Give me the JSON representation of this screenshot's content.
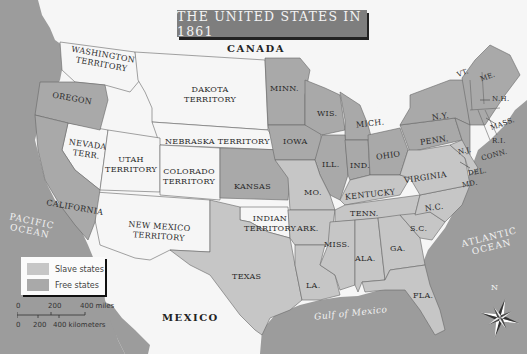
{
  "title": "THE UNITED STATES IN 1861",
  "colors": {
    "water": "#9c9c9c",
    "free_states": "#a9a9a9",
    "slave_states": "#c6c6c6",
    "territories": "#f6f6f6",
    "foreign": "#ffffff",
    "title_bg": "#7e7e7e",
    "border": "#5a5a5a"
  },
  "legend": {
    "items": [
      {
        "label": "Slave states",
        "color": "#c6c6c6"
      },
      {
        "label": "Free states",
        "color": "#a9a9a9"
      }
    ]
  },
  "scale": {
    "miles_ticks": [
      "0",
      "200",
      "400 miles"
    ],
    "km_ticks": [
      "0",
      "200",
      "400 kilometers"
    ]
  },
  "compass": {
    "north_label": "N"
  },
  "water_labels": {
    "pacific": [
      "PACIFIC",
      "OCEAN"
    ],
    "atlantic": [
      "ATLANTIC",
      "OCEAN"
    ],
    "gulf": "Gulf of Mexico"
  },
  "country_labels": {
    "canada": "CANADA",
    "mexico": "MEXICO"
  },
  "regions": {
    "washington": [
      "WASHINGTON",
      "TERRITORY"
    ],
    "oregon": "OREGON",
    "california": "CALIFORNIA",
    "nevada": [
      "NEVADA",
      "TERR."
    ],
    "utah": [
      "UTAH",
      "TERRITORY"
    ],
    "colorado": [
      "COLORADO",
      "TERRITORY"
    ],
    "new_mexico": [
      "NEW MEXICO",
      "TERRITORY"
    ],
    "dakota": [
      "DAKOTA",
      "TERRITORY"
    ],
    "nebraska": "NEBRASKA TERRITORY",
    "kansas": "KANSAS",
    "indian": [
      "INDIAN",
      "TERRITORY"
    ],
    "texas": "TEXAS",
    "minn": "MINN.",
    "iowa": "IOWA",
    "mo": "MO.",
    "ark": "ARK.",
    "la": "LA.",
    "wis": "WIS.",
    "ill": "ILL.",
    "mich": "MICH.",
    "ind": "IND.",
    "ohio": "OHIO",
    "kentucky": "KENTUCKY",
    "tenn": "TENN.",
    "miss": "MISS.",
    "ala": "ALA.",
    "ga": "GA.",
    "fla": "FLA.",
    "sc": "S.C.",
    "nc": "N.C.",
    "virginia": "VIRGINIA",
    "penn": "PENN.",
    "ny": "N.Y.",
    "nj": "N.J.",
    "del": "DEL.",
    "md": "MD.",
    "vt": "VT.",
    "nh": "N.H.",
    "me": "ME.",
    "mass": "MASS.",
    "ri": "R.I.",
    "conn": "CONN."
  }
}
